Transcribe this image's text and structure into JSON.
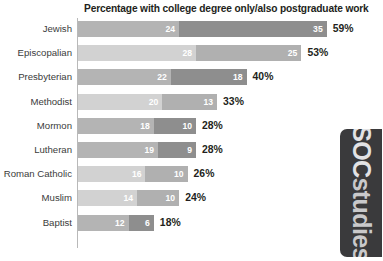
{
  "chart_data": {
    "type": "bar",
    "orientation": "horizontal",
    "stacked": true,
    "title": "Percentage with college degree only/also postgraduate work",
    "xlabel": "",
    "ylabel": "",
    "grid": false,
    "legend": "none",
    "xlim": [
      0,
      60
    ],
    "categories": [
      "Jewish",
      "Episcopalian",
      "Presbyterian",
      "Methodist",
      "Mormon",
      "Lutheran",
      "Roman Catholic",
      "Muslim",
      "Baptist"
    ],
    "series": [
      {
        "name": "college degree only",
        "values": [
          24,
          28,
          22,
          20,
          18,
          19,
          16,
          14,
          12
        ]
      },
      {
        "name": "also postgraduate work",
        "values": [
          35,
          25,
          18,
          13,
          10,
          9,
          10,
          10,
          6
        ]
      }
    ],
    "totals": [
      59,
      53,
      40,
      33,
      28,
      28,
      26,
      24,
      18
    ],
    "total_labels": [
      "59%",
      "53%",
      "40%",
      "33%",
      "28%",
      "28%",
      "26%",
      "24%",
      "18%"
    ],
    "rows": [
      {
        "label": "Jewish",
        "seg1": 24,
        "seg2": 35,
        "total": 59,
        "total_label": "59%",
        "shade": "dark"
      },
      {
        "label": "Episcopalian",
        "seg1": 28,
        "seg2": 25,
        "total": 53,
        "total_label": "53%",
        "shade": "light"
      },
      {
        "label": "Presbyterian",
        "seg1": 22,
        "seg2": 18,
        "total": 40,
        "total_label": "40%",
        "shade": "dark"
      },
      {
        "label": "Methodist",
        "seg1": 20,
        "seg2": 13,
        "total": 33,
        "total_label": "33%",
        "shade": "light"
      },
      {
        "label": "Mormon",
        "seg1": 18,
        "seg2": 10,
        "total": 28,
        "total_label": "28%",
        "shade": "dark"
      },
      {
        "label": "Lutheran",
        "seg1": 19,
        "seg2": 9,
        "total": 28,
        "total_label": "28%",
        "shade": "dark"
      },
      {
        "label": "Roman Catholic",
        "seg1": 16,
        "seg2": 10,
        "total": 26,
        "total_label": "26%",
        "shade": "light"
      },
      {
        "label": "Muslim",
        "seg1": 14,
        "seg2": 10,
        "total": 24,
        "total_label": "24%",
        "shade": "light"
      },
      {
        "label": "Baptist",
        "seg1": 12,
        "seg2": 6,
        "total": 18,
        "total_label": "18%",
        "shade": "dark"
      }
    ]
  },
  "colors": {
    "seg1_dark": "#b4b4b4",
    "seg2_dark": "#8e8e8e",
    "seg1_light": "#d2d2d2",
    "seg2_light": "#b0b0b0",
    "axis": "#b9b9b9",
    "title_text": "#231f20",
    "label_text": "#3b3b3b",
    "value_text": "#ffffff",
    "logo_bg": "#3a3a3c",
    "logo_text": "#c9c9cb",
    "background": "#ffffff"
  },
  "logo": {
    "prefix": "SOC",
    "suffix": "studies",
    "full": "SOCstudies"
  }
}
